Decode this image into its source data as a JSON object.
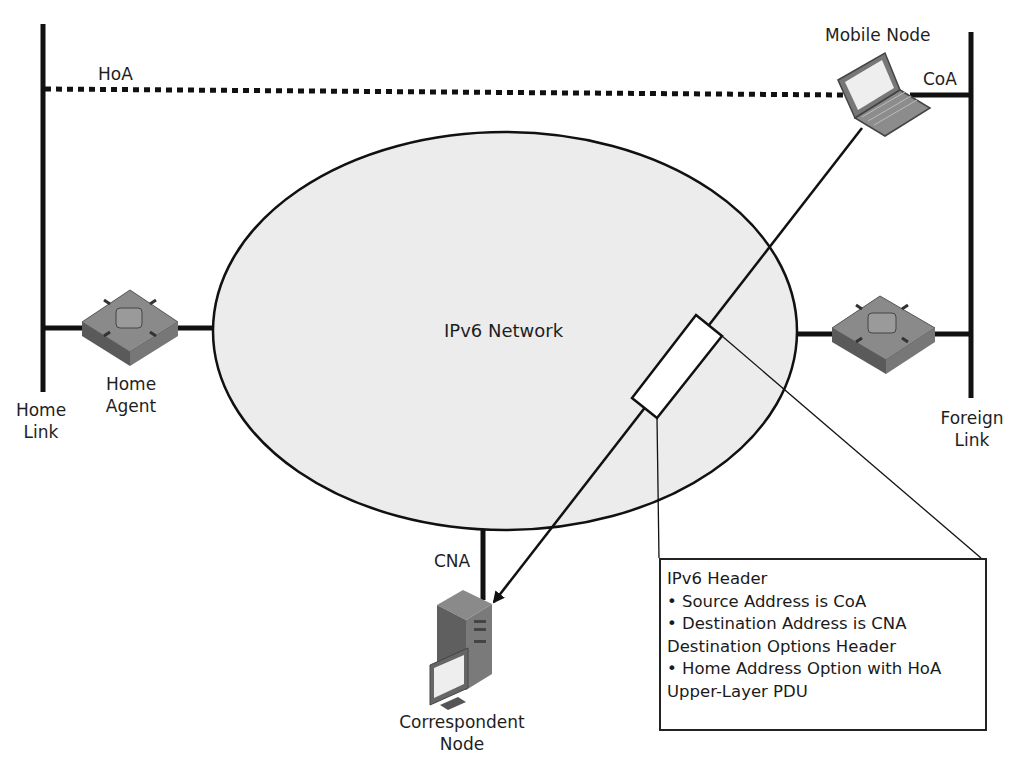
{
  "diagram": {
    "type": "Mobile IPv6 route optimization (correspondent node receives packet from mobile node)",
    "network_label": "IPv6 Network",
    "nodes": {
      "mobile_node": "Mobile Node",
      "home_agent_line1": "Home",
      "home_agent_line2": "Agent",
      "correspondent_line1": "Correspondent",
      "correspondent_line2": "Node"
    },
    "links": {
      "home_link_line1": "Home",
      "home_link_line2": "Link",
      "foreign_link_line1": "Foreign",
      "foreign_link_line2": "Link"
    },
    "addresses": {
      "hoa": "HoA",
      "coa": "CoA",
      "cna": "CNA"
    },
    "packet_callout": {
      "lines": [
        "IPv6 Header",
        "• Source Address is CoA",
        "• Destination Address is CNA",
        "Destination Options Header",
        "• Home Address Option with HoA",
        "Upper-Layer PDU"
      ]
    },
    "colors": {
      "network_fill": "#ececec",
      "line": "#111111",
      "device_gray": "#6e6e6e"
    }
  }
}
